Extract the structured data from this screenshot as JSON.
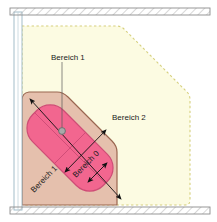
{
  "diagram": {
    "labels": {
      "zone1_callout": "Bereich 1",
      "zone2": "Bereich 2",
      "zone1_diagonal": "Bereich 1",
      "zone0_diagonal": "Bereich 0"
    },
    "zones": [
      {
        "id": "zone-2",
        "label": "Bereich 2",
        "fill": "#fcfbe0",
        "stroke": "#d8d48a",
        "stroke_style": "dashed"
      },
      {
        "id": "zone-1",
        "label": "Bereich 1",
        "fill": "#e8c4b0",
        "stroke": "#9e6a52",
        "stroke_style": "solid"
      },
      {
        "id": "zone-0",
        "label": "Bereich 0",
        "fill": "#f2668f",
        "stroke": "#c4456f",
        "stroke_style": "solid"
      }
    ],
    "structure": {
      "wall_fill": "#e4e4e4",
      "wall_stroke": "#8a8a8a",
      "wall_hatch_color": "#b0b0b0",
      "floor_line_color": "#9ab7c4"
    },
    "marker": {
      "name": "source-point",
      "fill": "#a8a8a8",
      "stroke": "#6b6b6b"
    },
    "dimension_arrow_color": "#1a1a1a",
    "leader_line_color": "#4a4a4a"
  }
}
